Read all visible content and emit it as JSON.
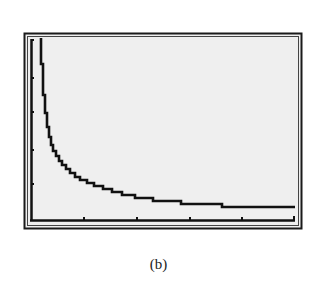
{
  "caption": "(b)",
  "colors": {
    "screen": "#efefef",
    "ink": "#111111",
    "frame": "#1a1a1a"
  },
  "chart_data": {
    "type": "line",
    "style": "graphing-calculator step plot",
    "title": "",
    "xlabel": "",
    "ylabel": "",
    "x_ticks": 5,
    "y_ticks": 4,
    "grid": false,
    "legend": null,
    "points_px": [
      [
        41,
        38
      ],
      [
        41,
        64
      ],
      [
        43,
        64
      ],
      [
        43,
        95
      ],
      [
        45,
        95
      ],
      [
        45,
        113
      ],
      [
        47,
        113
      ],
      [
        47,
        127
      ],
      [
        49,
        127
      ],
      [
        49,
        137
      ],
      [
        51,
        137
      ],
      [
        51,
        145
      ],
      [
        53,
        145
      ],
      [
        53,
        151
      ],
      [
        56,
        151
      ],
      [
        56,
        156
      ],
      [
        59,
        156
      ],
      [
        59,
        161
      ],
      [
        62,
        161
      ],
      [
        62,
        165
      ],
      [
        66,
        165
      ],
      [
        66,
        169
      ],
      [
        70,
        169
      ],
      [
        70,
        173
      ],
      [
        75,
        173
      ],
      [
        75,
        177
      ],
      [
        80,
        177
      ],
      [
        80,
        180
      ],
      [
        87,
        180
      ],
      [
        87,
        183
      ],
      [
        94,
        183
      ],
      [
        94,
        186
      ],
      [
        103,
        186
      ],
      [
        103,
        189
      ],
      [
        112,
        189
      ],
      [
        112,
        192
      ],
      [
        122,
        192
      ],
      [
        122,
        195
      ],
      [
        135,
        195
      ],
      [
        135,
        198
      ],
      [
        153,
        198
      ],
      [
        153,
        201
      ],
      [
        181,
        201
      ],
      [
        181,
        204
      ],
      [
        222,
        204
      ],
      [
        222,
        207
      ],
      [
        295,
        207
      ]
    ]
  }
}
